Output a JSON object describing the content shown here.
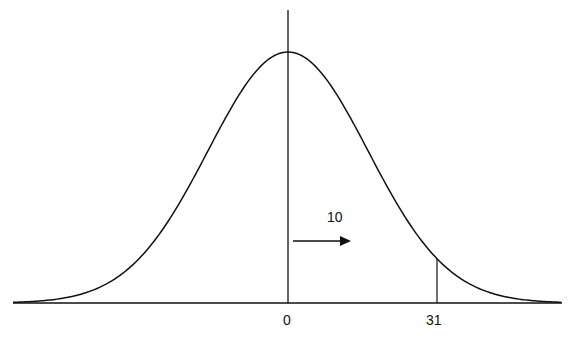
{
  "diagram": {
    "type": "normal-distribution",
    "mean_label": "0",
    "cutoff_label": "31",
    "shift_label": "10",
    "shift_direction": "right",
    "colors": {
      "stroke": "#111111",
      "background": "#ffffff"
    }
  }
}
